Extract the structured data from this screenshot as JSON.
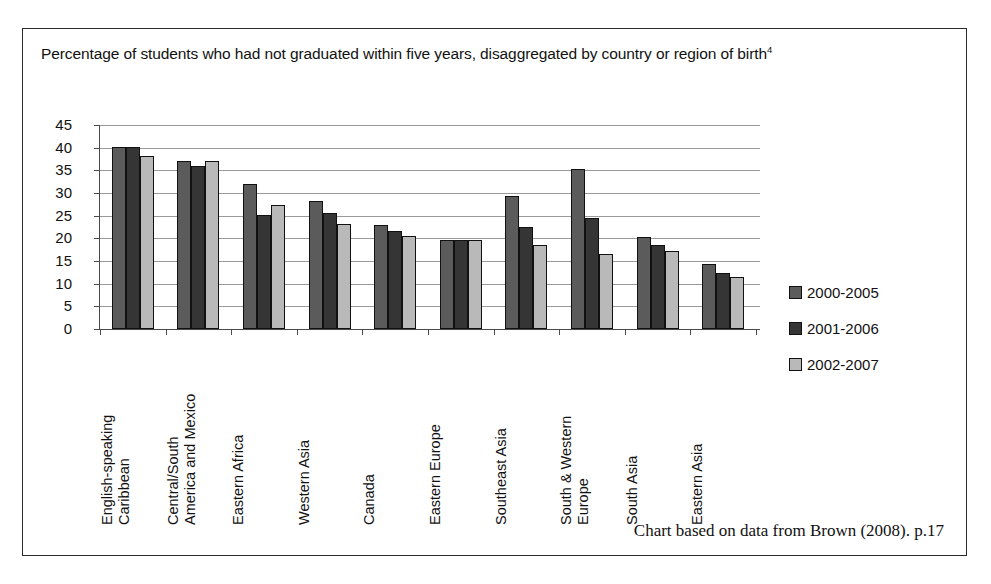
{
  "figure": {
    "title_text": "Percentage of students who had not graduated within five years, disaggregated by country or region of birth",
    "title_footnote": "4",
    "source_note": "Chart based on data from Brown (2008). p.17",
    "frame_color": "#2b2b2b"
  },
  "legend": {
    "position": "right",
    "items": [
      {
        "label": "2000-2005",
        "color": "#5b5b5b"
      },
      {
        "label": "2001-2006",
        "color": "#353535"
      },
      {
        "label": "2002-2007",
        "color": "#b9b9b9"
      }
    ]
  },
  "chart_data": {
    "type": "bar",
    "title": "Percentage of students who had not graduated within five years, disaggregated by country or region of birth",
    "xlabel": "",
    "ylabel": "",
    "ylim": [
      0,
      45
    ],
    "ytick_step": 5,
    "yticks": [
      45,
      40,
      35,
      30,
      25,
      20,
      15,
      10,
      5,
      0
    ],
    "grid": true,
    "legend_position": "right",
    "categories": [
      "English-speaking\nCaribbean",
      "Central/South\nAmerica and Mexico",
      "Eastern Africa",
      "Western Asia",
      "Canada",
      "Eastern Europe",
      "Southeast Asia",
      "South & Western\nEurope",
      "South Asia",
      "Eastern Asia"
    ],
    "series": [
      {
        "name": "2000-2005",
        "color": "#5b5b5b",
        "values": [
          40.2,
          37.0,
          32.0,
          28.3,
          23.0,
          19.6,
          29.4,
          35.4,
          20.4,
          14.4
        ]
      },
      {
        "name": "2001-2006",
        "color": "#353535",
        "values": [
          40.2,
          36.0,
          25.2,
          25.7,
          21.6,
          19.6,
          22.4,
          24.5,
          18.5,
          12.4
        ]
      },
      {
        "name": "2002-2007",
        "color": "#b9b9b9",
        "values": [
          38.2,
          37.0,
          27.3,
          23.1,
          20.6,
          19.6,
          18.5,
          16.5,
          17.1,
          11.5
        ]
      }
    ]
  }
}
